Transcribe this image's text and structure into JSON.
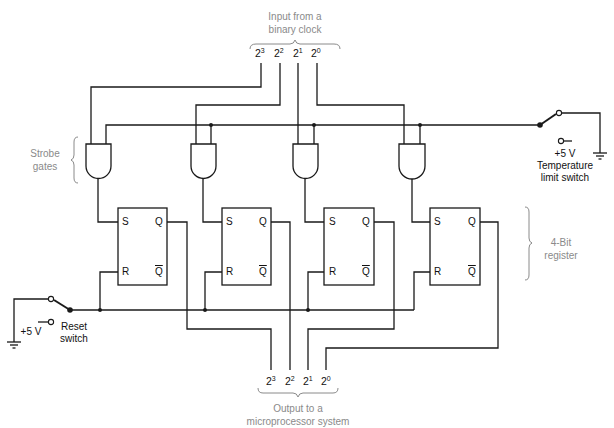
{
  "figure": {
    "input_label": "Input from a binary clock",
    "input_label_lines": [
      "Input from a",
      "binary clock"
    ],
    "output_label_lines": [
      "Output to a",
      "microprocessor system"
    ],
    "strobe_label_lines": [
      "Strobe",
      "gates"
    ],
    "register_label_lines": [
      "4-Bit",
      "register"
    ],
    "bits": [
      {
        "base": "2",
        "exp": "3"
      },
      {
        "base": "2",
        "exp": "2"
      },
      {
        "base": "2",
        "exp": "1"
      },
      {
        "base": "2",
        "exp": "0"
      }
    ],
    "flip_flops": [
      {
        "s": "S",
        "r": "R",
        "q": "Q",
        "qbar": "Q"
      },
      {
        "s": "S",
        "r": "R",
        "q": "Q",
        "qbar": "Q"
      },
      {
        "s": "S",
        "r": "R",
        "q": "Q",
        "qbar": "Q"
      },
      {
        "s": "S",
        "r": "R",
        "q": "Q",
        "qbar": "Q"
      }
    ],
    "temperature_switch": {
      "voltage": "+5 V",
      "label_lines": [
        "Temperature",
        "limit switch"
      ]
    },
    "reset_switch": {
      "voltage": "+5 V",
      "label_lines": [
        "Reset",
        "switch"
      ]
    },
    "colors": {
      "line": "#1a1a1a",
      "annotation": "#8a8a8a",
      "background": "#ffffff"
    }
  }
}
